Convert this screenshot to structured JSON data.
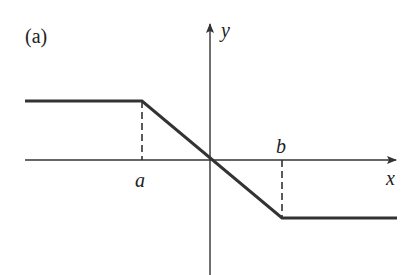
{
  "figure": {
    "panel_label": "(a)",
    "axes": {
      "x_label": "x",
      "y_label": "y"
    },
    "markers": {
      "a_label": "a",
      "b_label": "b"
    },
    "colors": {
      "line": "#333333",
      "axis": "#333333",
      "background": "#ffffff"
    }
  }
}
